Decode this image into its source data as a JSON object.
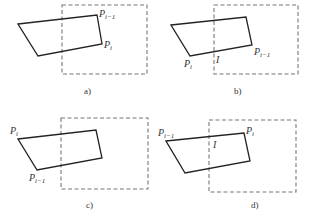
{
  "diagram": {
    "colors": {
      "polygon": "#222222",
      "clip_window": "#777777",
      "text": "#333333"
    },
    "panels": [
      {
        "caption": "a)",
        "clip_window": {
          "x": 62,
          "y": 5,
          "w": 85,
          "h": 69
        },
        "polygon": [
          [
            18,
            24
          ],
          [
            97,
            15
          ],
          [
            102,
            44
          ],
          [
            38,
            56
          ]
        ],
        "labels": [
          {
            "base": "P",
            "sub": "i−1",
            "x": 99,
            "y": 17
          },
          {
            "base": "P",
            "sub": "i",
            "x": 104,
            "y": 48
          }
        ]
      },
      {
        "caption": "b)",
        "clip_window": {
          "x": 214,
          "y": 5,
          "w": 84,
          "h": 69
        },
        "polygon": [
          [
            171,
            25
          ],
          [
            246,
            17
          ],
          [
            252,
            45
          ],
          [
            190,
            56
          ]
        ],
        "labels": [
          {
            "base": "P",
            "sub": "i",
            "x": 184,
            "y": 67
          },
          {
            "base": "I",
            "sub": "",
            "x": 216,
            "y": 63
          },
          {
            "base": "P",
            "sub": "i−1",
            "x": 254,
            "y": 55
          }
        ]
      },
      {
        "caption": "c)",
        "clip_window": {
          "x": 61,
          "y": 118,
          "w": 87,
          "h": 71
        },
        "polygon": [
          [
            18,
            139
          ],
          [
            96,
            130
          ],
          [
            102,
            158
          ],
          [
            37,
            170
          ]
        ],
        "labels": [
          {
            "base": "P",
            "sub": "i",
            "x": 10,
            "y": 134
          },
          {
            "base": "P",
            "sub": "i−1",
            "x": 29,
            "y": 181
          }
        ]
      },
      {
        "caption": "d)",
        "clip_window": {
          "x": 209,
          "y": 120,
          "w": 87,
          "h": 72
        },
        "polygon": [
          [
            166,
            141
          ],
          [
            244,
            133
          ],
          [
            250,
            161
          ],
          [
            185,
            173
          ]
        ],
        "labels": [
          {
            "base": "P",
            "sub": "i−1",
            "x": 158,
            "y": 136
          },
          {
            "base": "I",
            "sub": "",
            "x": 213,
            "y": 148
          },
          {
            "base": "P",
            "sub": "i",
            "x": 246,
            "y": 134
          }
        ]
      }
    ],
    "caption_positions": [
      [
        84,
        94
      ],
      [
        234,
        94
      ],
      [
        86,
        208
      ],
      [
        251,
        208
      ]
    ]
  }
}
